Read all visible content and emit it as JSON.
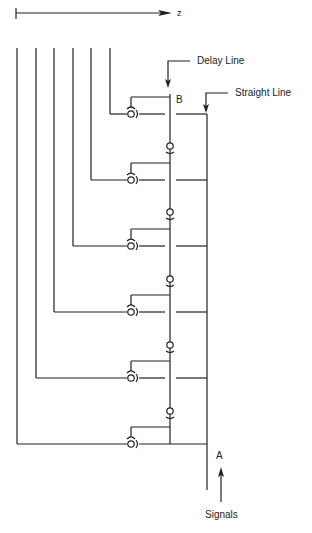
{
  "diagram": {
    "axis": {
      "label": "z",
      "x_start": 16,
      "x_end": 172,
      "y": 13
    },
    "labels": {
      "delay_line": "Delay Line",
      "straight_line": "Straight Line",
      "node_b": "B",
      "node_a": "A",
      "signals": "Signals"
    },
    "colors": {
      "line": "#222222",
      "background": "#ffffff"
    },
    "vertical_lines_x": [
      17,
      36,
      54,
      73,
      91,
      110
    ],
    "vertical_lines_top_y": 48,
    "rows_y": [
      114,
      180,
      246,
      312,
      378,
      444
    ],
    "delay_line_x": 170,
    "straight_line_x": 207,
    "coupler_x": 131,
    "delay_couplers_y": [
      146,
      212,
      279,
      345,
      411
    ],
    "stage_count": 6
  }
}
